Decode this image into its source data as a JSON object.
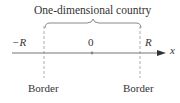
{
  "diagram": {
    "title": "One-dimensional country",
    "axis_label": "x",
    "left_label": "−R",
    "center_label": "0",
    "right_label": "R",
    "left_border_label": "Border",
    "right_border_label": "Border",
    "colors": {
      "line": "#777777",
      "text": "#333333",
      "dash": "#999999"
    }
  }
}
